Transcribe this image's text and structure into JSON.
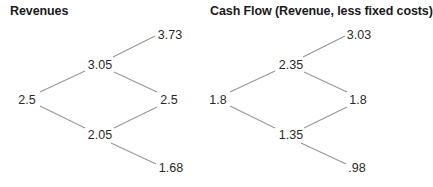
{
  "diagrams": [
    {
      "title": "Revenues",
      "nodes": {
        "root": "2.5",
        "up": "3.05",
        "down": "2.05",
        "upup": "3.73",
        "updown": "2.5",
        "downdown": "1.68"
      }
    },
    {
      "title": "Cash Flow (Revenue, less fixed costs)",
      "nodes": {
        "root": "1.8",
        "up": "2.35",
        "down": "1.35",
        "upup": "3.03",
        "updown": "1.8",
        "downdown": ".98"
      }
    }
  ],
  "colors": {
    "line": "#9a9a9a",
    "text": "#2a2a2a"
  }
}
